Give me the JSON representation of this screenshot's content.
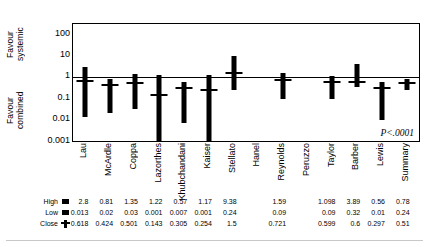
{
  "axis": {
    "favour_top": "Favour\nsystemic",
    "favour_bottom": "Favour\ncombined",
    "yticks": [
      "100",
      "10",
      "1",
      "0.1",
      "0.01",
      "0.001"
    ]
  },
  "annotation": {
    "pvalue": "P<.0001"
  },
  "table": {
    "rows": [
      {
        "label": "High",
        "icon": "filled-square-marker"
      },
      {
        "label": "Low",
        "icon": "filled-square-marker"
      },
      {
        "label": "Close",
        "icon": "close-tick-marker"
      }
    ]
  },
  "chart_data": {
    "type": "bar",
    "subtype": "high-low-close forest plot",
    "title": "",
    "xlabel": "",
    "ylabel": "",
    "yscale": "log",
    "ylim": [
      0.001,
      300
    ],
    "gridlines": false,
    "reference_line": 1,
    "categories": [
      "Lau",
      "McArdle",
      "Coppa",
      "Lazorthes",
      "Khubchandani",
      "Kaiser",
      "Stellato",
      "Hanel",
      "Reynolds",
      "Peruzzo",
      "Taylor",
      "Barber",
      "Lewis",
      "Summary"
    ],
    "series": [
      {
        "name": "High",
        "values": [
          2.8,
          0.81,
          1.35,
          1.22,
          0.57,
          1.17,
          9.38,
          null,
          1.59,
          null,
          1.098,
          3.89,
          0.56,
          0.78
        ]
      },
      {
        "name": "Low",
        "values": [
          0.013,
          0.02,
          0.03,
          0.001,
          0.007,
          0.001,
          0.24,
          null,
          0.09,
          null,
          0.09,
          0.32,
          0.01,
          0.24
        ]
      },
      {
        "name": "Close",
        "values": [
          0.618,
          0.424,
          0.501,
          0.143,
          0.305,
          0.254,
          1.5,
          null,
          0.721,
          null,
          0.599,
          0.6,
          0.297,
          0.51
        ]
      }
    ]
  }
}
